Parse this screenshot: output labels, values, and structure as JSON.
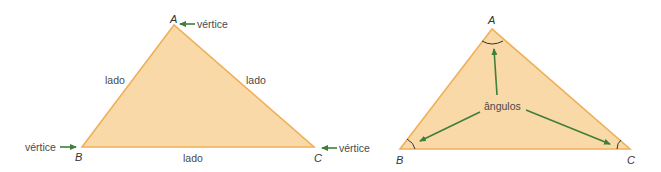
{
  "colors": {
    "fill": "#f9d9a8",
    "stroke": "#f0b05a",
    "arrow": "#3f7f3a",
    "text": "#4a4a4a",
    "angle_arc": "#333333"
  },
  "left_triangle": {
    "vertices": {
      "A": "A",
      "B": "B",
      "C": "C"
    },
    "vertex_label_a": "vértice",
    "vertex_label_b": "vértice",
    "vertex_label_c": "vértice",
    "side_ab": "lado",
    "side_ac": "lado",
    "side_bc": "lado"
  },
  "right_triangle": {
    "vertices": {
      "A": "A",
      "B": "B",
      "C": "C"
    },
    "angles_label": "ângulos"
  }
}
